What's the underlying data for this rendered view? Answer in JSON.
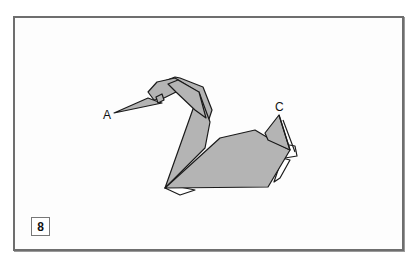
{
  "diagram": {
    "step_number": "8",
    "labels": {
      "point_a": "A",
      "point_c": "C"
    },
    "colors": {
      "paper_fill": "#b4b4b4",
      "paper_back": "#ffffff",
      "outline": "#1a1a1a",
      "frame_border": "#6e6e6e"
    }
  }
}
